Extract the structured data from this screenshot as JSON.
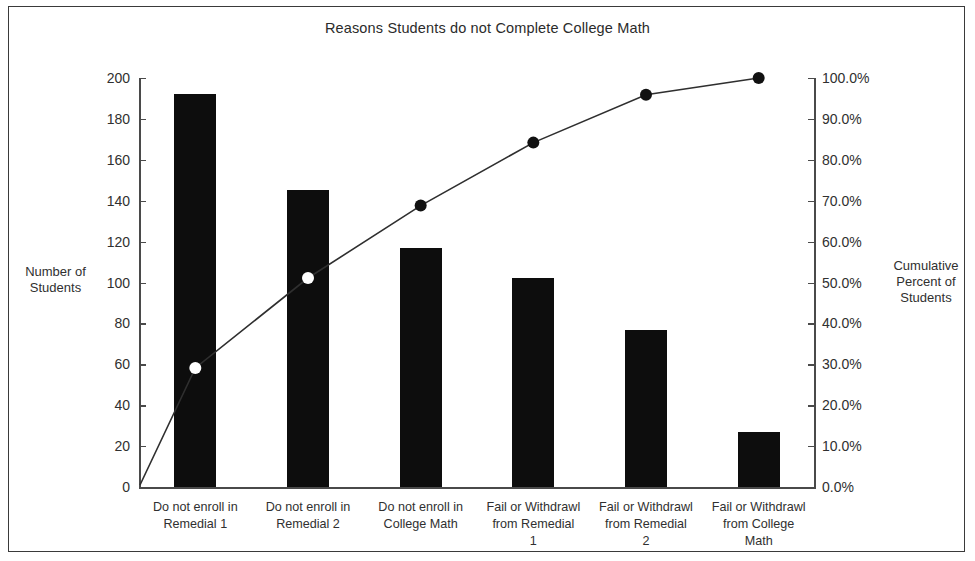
{
  "chart_data": {
    "type": "bar",
    "title": "Reasons Students do not Complete College Math",
    "xlabel": "",
    "ylabel": "Number of Students",
    "y2label": "Cumulative Percent of Students",
    "ylim": [
      0,
      200
    ],
    "y2lim": [
      0,
      100
    ],
    "grid": false,
    "legend": "none",
    "categories": [
      "Do not enroll in Remedial 1",
      "Do not enroll in Remedial 2",
      "Do not enroll in College Math",
      "Fail or Withdrawl from Remedial 1",
      "Fail or Withdrawl from Remedial 2",
      "Fail or Withdrawl from College Math"
    ],
    "series": [
      {
        "name": "Number of Students",
        "type": "bar",
        "axis": "left",
        "values": [
          192,
          145,
          117,
          102,
          77,
          27
        ]
      },
      {
        "name": "Cumulative Percent of Students",
        "type": "line",
        "axis": "right",
        "values": [
          29.1,
          51.1,
          68.8,
          84.2,
          95.9,
          100.0
        ]
      }
    ],
    "yticks": [
      0,
      20,
      40,
      60,
      80,
      100,
      120,
      140,
      160,
      180,
      200
    ],
    "ytick_labels": [
      "0",
      "20",
      "40",
      "60",
      "80",
      "100",
      "120",
      "140",
      "160",
      "180",
      "200"
    ],
    "y2ticks": [
      0,
      10,
      20,
      30,
      40,
      50,
      60,
      70,
      80,
      90,
      100
    ],
    "y2tick_labels": [
      "0.0%",
      "10.0%",
      "20.0%",
      "30.0%",
      "40.0%",
      "50.0%",
      "60.0%",
      "70.0%",
      "80.0%",
      "90.0%",
      "100.0%"
    ],
    "colors": {
      "bar": "#0d0d0d",
      "line": "#2f2f2f",
      "marker": "#111111",
      "axis": "#4a4a4a",
      "text": "#303030",
      "background": "#ffffff",
      "border": "#3a3a3a"
    },
    "category_lines": [
      [
        "Do not enroll in",
        "Remedial 1"
      ],
      [
        "Do not enroll in",
        "Remedial 2"
      ],
      [
        "Do not enroll in",
        "College Math"
      ],
      [
        "Fail or Withdrawl",
        "from Remedial",
        "1"
      ],
      [
        "Fail or Withdrawl",
        "from Remedial",
        "2"
      ],
      [
        "Fail or Withdrawl",
        "from College",
        "Math"
      ]
    ],
    "axis_title_left_lines": [
      "Number of",
      "Students"
    ],
    "axis_title_right_lines": [
      "Cumulative",
      "Percent of",
      "Students"
    ]
  }
}
